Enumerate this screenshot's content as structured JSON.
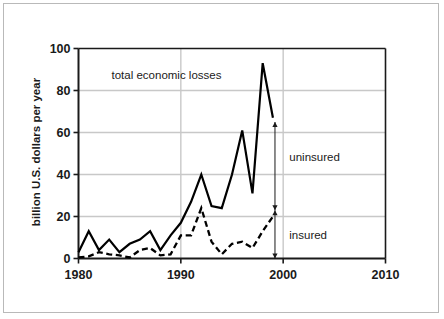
{
  "chart_data": {
    "type": "line",
    "title": "",
    "xlabel": "",
    "ylabel": "billion U.S. dollars per year",
    "xlim": [
      1980,
      2010
    ],
    "ylim": [
      0,
      100
    ],
    "xticks": [
      "1980",
      "1990",
      "2000",
      "2010"
    ],
    "xtick_values": [
      1980,
      1990,
      2000,
      2010
    ],
    "yticks": [
      "0",
      "20",
      "40",
      "60",
      "80",
      "100"
    ],
    "ytick_values": [
      0,
      20,
      40,
      60,
      80,
      100
    ],
    "grid": "horizontal",
    "legend": "none",
    "x": [
      1980,
      1981,
      1982,
      1983,
      1984,
      1985,
      1986,
      1987,
      1988,
      1989,
      1990,
      1991,
      1992,
      1993,
      1994,
      1995,
      1996,
      1997,
      1998,
      1999
    ],
    "series": [
      {
        "name": "total economic losses",
        "style": "solid",
        "color": "#000000",
        "values": [
          3,
          13,
          4,
          9,
          3,
          7,
          9,
          13,
          4,
          11,
          17,
          27,
          40,
          25,
          24,
          40,
          61,
          31,
          93,
          67
        ]
      },
      {
        "name": "insured losses",
        "style": "dashed",
        "color": "#000000",
        "values": [
          0.5,
          1,
          3,
          2,
          1.5,
          0.5,
          4,
          5,
          1.5,
          2,
          11,
          11,
          24,
          8,
          2,
          7,
          8,
          5,
          13,
          20
        ]
      }
    ],
    "annotations": [
      {
        "id": "total-economic-losses",
        "text": "total economic losses",
        "x": 1988.6,
        "y": 85.5
      },
      {
        "id": "uninsured",
        "text": "uninsured",
        "x": 2000.6,
        "y": 46.5
      },
      {
        "id": "insured",
        "text": "insured",
        "x": 2000.6,
        "y": 9.5
      }
    ],
    "arrows": [
      {
        "id": "uninsured-span-arrow",
        "x": 1999.2,
        "y_from": 65,
        "y_to": 23,
        "double_headed": true
      },
      {
        "id": "insured-span-arrow",
        "x": 1999.2,
        "y_from": 23,
        "y_to": 0,
        "double_headed": true
      }
    ],
    "colors": {
      "axis": "#1a1a1a",
      "gridline": "#c8c8c8",
      "line": "#000000",
      "background": "#ffffff",
      "frame_border": "#b9b9b9"
    }
  }
}
